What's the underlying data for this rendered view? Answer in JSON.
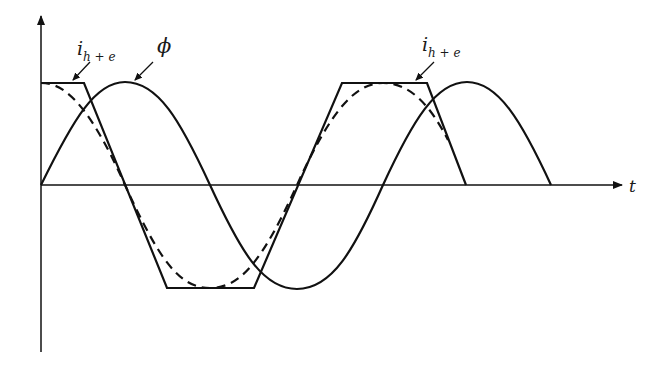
{
  "diagram": {
    "title": "",
    "axes": {
      "x_label": "t",
      "y_label": ""
    },
    "labels": {
      "current_left": {
        "main": "i",
        "sub": "h + e"
      },
      "flux": "ϕ",
      "current_right": {
        "main": "i",
        "sub": "h + e"
      }
    },
    "curves": [
      {
        "name": "flux",
        "symbol": "ϕ",
        "style": "solid",
        "shape": "sine"
      },
      {
        "name": "magnetizing-current",
        "symbol": "i_h+e",
        "style": "solid",
        "shape": "trapezoid (clipped)"
      },
      {
        "name": "fundamental-current",
        "style": "dashed",
        "shape": "cosine"
      }
    ],
    "colors": {
      "stroke": "#111111",
      "background": "#ffffff"
    }
  }
}
